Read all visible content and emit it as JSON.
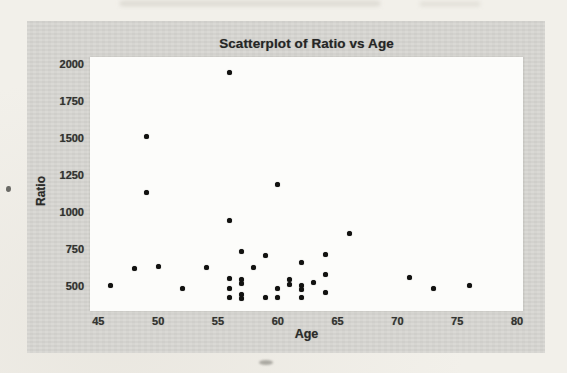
{
  "colors": {
    "page_background": "#f2f0ea",
    "figure_background": "#d7d6d2",
    "plot_background": "#fcfcfa",
    "point_color": "#121210",
    "text_color": "#2b2b29"
  },
  "chart_data": {
    "type": "scatter",
    "title": "Scatterplot of Ratio vs Age",
    "xlabel": "Age",
    "ylabel": "Ratio",
    "xlim": [
      44.3,
      80.5
    ],
    "ylim": [
      330,
      2050
    ],
    "x_ticks": [
      45,
      50,
      55,
      60,
      65,
      70,
      75,
      80
    ],
    "y_ticks": [
      2000,
      1750,
      1500,
      1250,
      1000,
      750,
      500
    ],
    "grid": false,
    "legend": "none",
    "points": [
      [
        46,
        500
      ],
      [
        48,
        615
      ],
      [
        49,
        1515
      ],
      [
        49,
        1135
      ],
      [
        50,
        630
      ],
      [
        52,
        480
      ],
      [
        54,
        625
      ],
      [
        56,
        1945
      ],
      [
        56,
        940
      ],
      [
        56,
        550
      ],
      [
        56,
        480
      ],
      [
        56,
        420
      ],
      [
        57,
        730
      ],
      [
        57,
        540
      ],
      [
        57,
        515
      ],
      [
        57,
        445
      ],
      [
        57,
        415
      ],
      [
        58,
        625
      ],
      [
        59,
        705
      ],
      [
        59,
        420
      ],
      [
        60,
        1185
      ],
      [
        60,
        485
      ],
      [
        60,
        420
      ],
      [
        61,
        540
      ],
      [
        61,
        512
      ],
      [
        62,
        660
      ],
      [
        62,
        500
      ],
      [
        62,
        478
      ],
      [
        62,
        420
      ],
      [
        63,
        523
      ],
      [
        64,
        715
      ],
      [
        64,
        577
      ],
      [
        64,
        454
      ],
      [
        66,
        855
      ],
      [
        71,
        555
      ],
      [
        73,
        480
      ],
      [
        76,
        500
      ]
    ]
  }
}
